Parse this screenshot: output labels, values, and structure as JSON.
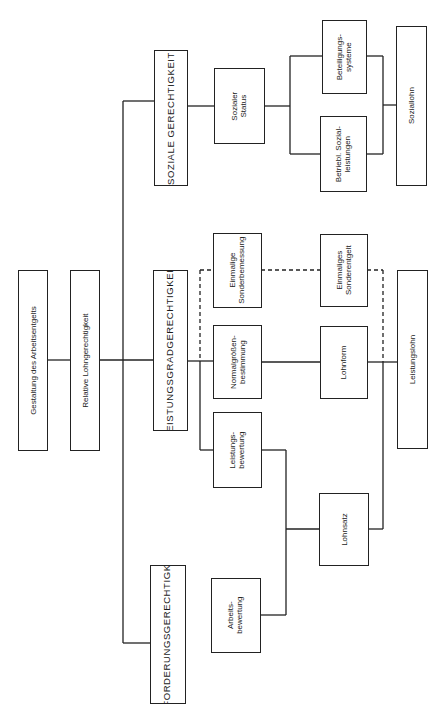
{
  "diagram": {
    "type": "hierarchy-flowchart",
    "orientation": "rotated-90-ccw",
    "root": {
      "label": "Gestaltung des Arbeitsentgelts"
    },
    "level1": {
      "label": "Relative Lohngerechtigkeit"
    },
    "pillars": [
      {
        "id": "sozial",
        "label": "SOZIALE GERECHTIGKEIT"
      },
      {
        "id": "leistung",
        "label": "LEISTUNGSGRADGERECHTIGKEIT"
      },
      {
        "id": "anforderung",
        "label": "ANFORDERUNGSGERECHTIGKEIT"
      }
    ],
    "criteria": {
      "sozialer_status": "Sozialer\nStatus",
      "einmalige_sonderbemessung": "Einmalige\nSonderbemessung",
      "normalgroessenbestimmung": "Normalgrößen-\nbestimmung",
      "leistungsbewertung": "Leistungs-\nbewertung",
      "arbeitsbewertung": "Arbeits-\nbewertung"
    },
    "instruments": {
      "beteiligungssysteme": "Beteiligungs-\nsysteme",
      "betriebl_sozialleistungen": "Betriebl. Sozial-\nleistungen",
      "einmaliges_sonderentgelt": "Einmaliges\nSonderentgelt",
      "lohnform": "Lohnform",
      "lohnsatz": "Lohnsatz"
    },
    "outcomes": {
      "soziallohn": "Soziallohn",
      "leistungslohn": "Leistungslohn"
    },
    "line_styles": {
      "solid": "connection",
      "dashed": "optional connection (Einmalige Sonderbemessung → Einmaliges Sonderentgelt)"
    }
  }
}
